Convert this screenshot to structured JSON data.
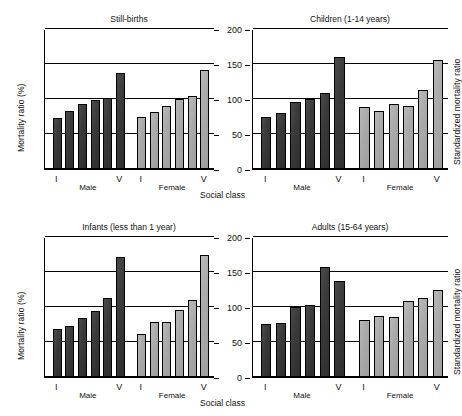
{
  "figure": {
    "y_axis_label_left": "Mortality ratio (%)",
    "y_axis_label_right": "Standardized mortality ratio",
    "x_axis_label": "Social class",
    "caption": ""
  },
  "axis": {
    "ticks": [
      "0",
      "50",
      "100",
      "150",
      "200"
    ],
    "tick_values": [
      0,
      50,
      100,
      150,
      200
    ],
    "ymin": 0,
    "ymax": 200
  },
  "groups": {
    "male_label": "Male",
    "female_label": "Female",
    "class_first": "I",
    "class_last": "V"
  },
  "colors": {
    "male_bar": "#3a3a3a",
    "female_bar": "#a9a9a9",
    "axis": "#000000"
  },
  "panels": [
    {
      "title": "Still-births"
    },
    {
      "title": "Children (1-14 years)"
    },
    {
      "title": "Infants (less than 1 year)"
    },
    {
      "title": "Adults (15-64 years)"
    }
  ],
  "chart_data": {
    "type": "bar",
    "xlabel": "Social class",
    "ylabel": "Mortality ratio (%)",
    "ylabel_right": "Standardized mortality ratio",
    "ylim": [
      0,
      200
    ],
    "yticks": [
      0,
      50,
      100,
      150,
      200
    ],
    "grid": true,
    "legend": "none",
    "categories": [
      "I",
      "II",
      "IIIN",
      "IIIM",
      "IV",
      "V"
    ],
    "panels": [
      {
        "name": "Still-births",
        "series": [
          {
            "name": "Male",
            "values": [
              73,
              83,
              93,
              99,
              102,
              137
            ]
          },
          {
            "name": "Female",
            "values": [
              75,
              81,
              90,
              100,
              105,
              141
            ]
          }
        ]
      },
      {
        "name": "Children (1-14 years)",
        "series": [
          {
            "name": "Male",
            "values": [
              74,
              80,
              96,
              100,
              109,
              160
            ]
          },
          {
            "name": "Female",
            "values": [
              89,
              83,
              93,
              90,
              113,
              156
            ]
          }
        ]
      },
      {
        "name": "Infants (less than 1 year)",
        "series": [
          {
            "name": "Male",
            "values": [
              69,
              73,
              84,
              94,
              113,
              172
            ]
          },
          {
            "name": "Female",
            "values": [
              61,
              78,
              78,
              96,
              110,
              174
            ]
          }
        ]
      },
      {
        "name": "Adults (15-64 years)",
        "series": [
          {
            "name": "Male",
            "values": [
              76,
              77,
              100,
              103,
              157,
              137
            ]
          },
          {
            "name": "Female",
            "values": [
              81,
              87,
              86,
              109,
              113,
              124
            ]
          }
        ]
      }
    ]
  }
}
